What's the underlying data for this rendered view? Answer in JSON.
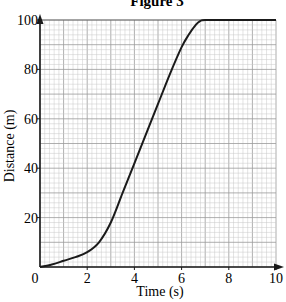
{
  "chart_data": {
    "type": "line",
    "title": "Figure 3",
    "xlabel": "Time (s)",
    "ylabel": "Distance (m)",
    "xlim": [
      0,
      10
    ],
    "ylim": [
      0,
      100
    ],
    "x_ticks": [
      0,
      2,
      4,
      6,
      8,
      10
    ],
    "x_tick_labels": [
      "0",
      "2",
      "4",
      "6",
      "8",
      "10"
    ],
    "y_ticks": [
      20,
      40,
      60,
      80,
      100
    ],
    "y_tick_labels": [
      "20",
      "40",
      "60",
      "80",
      "100"
    ],
    "grid": true,
    "grid_minor_x": 0.2,
    "grid_minor_y": 2,
    "legend": null,
    "series": [
      {
        "name": "Distance",
        "x": [
          0,
          0.5,
          1,
          1.5,
          2,
          2.5,
          3,
          3.5,
          4,
          4.5,
          5,
          5.5,
          6,
          6.3,
          6.6,
          6.8,
          7,
          8,
          9,
          10
        ],
        "y": [
          0,
          1,
          2.5,
          4,
          6,
          10,
          18,
          30,
          42,
          54,
          66,
          78,
          89,
          94,
          98,
          99.6,
          100,
          100,
          100,
          100
        ]
      }
    ]
  },
  "colors": {
    "curve": "#1a1a1a",
    "axis": "#1a1a1a",
    "grid_minor": "#c8c8c8",
    "grid_major": "#9a9a9a"
  }
}
